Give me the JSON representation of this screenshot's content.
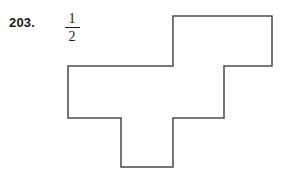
{
  "problem": {
    "number_label": "203.",
    "fraction": {
      "numerator": "1",
      "denominator": "2"
    }
  },
  "figure": {
    "name": "cross-step-polygon",
    "stroke_color": "#4a4a4a",
    "fill_color": "#ffffff",
    "stroke_width": 1.5,
    "points": "173,16 272,16 272,66 224,66 224,118 173,118 173,167 121,167 121,118 68,118 68,66 173,66",
    "vertices": [
      [
        173,
        16
      ],
      [
        272,
        16
      ],
      [
        272,
        66
      ],
      [
        224,
        66
      ],
      [
        224,
        118
      ],
      [
        173,
        118
      ],
      [
        173,
        167
      ],
      [
        121,
        167
      ],
      [
        121,
        118
      ],
      [
        68,
        118
      ],
      [
        68,
        66
      ],
      [
        173,
        66
      ]
    ]
  }
}
